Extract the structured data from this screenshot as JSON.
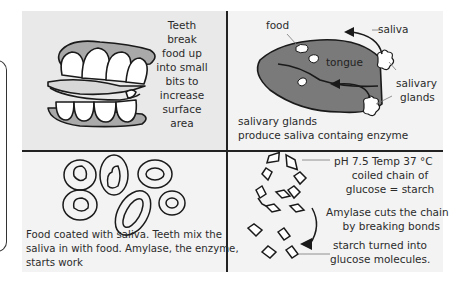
{
  "panels": {
    "teeth": {
      "caption_lines": [
        "Teeth",
        "break",
        "food up",
        "into small",
        "bits to",
        "increase",
        "surface",
        "area"
      ]
    },
    "tongue": {
      "labels": {
        "food": "food",
        "saliva": "saliva",
        "tongue": "tongue",
        "salivary_glands_1": "salivary",
        "salivary_glands_2": "glands"
      },
      "caption_lines": [
        "salivary glands",
        "produce saliva containg enzyme"
      ]
    },
    "mixing": {
      "caption_lines": [
        "Food coated with saliva. Teeth mix the",
        "saliva in with food. Amylase, the enzyme,",
        "starts work"
      ]
    },
    "starch": {
      "conditions": "pH 7.5 Temp 37 °C",
      "chain_label_lines": [
        "coiled chain of",
        "glucose = starch"
      ],
      "amylase_lines": [
        "Amylase cuts the chain",
        "by breaking bonds"
      ],
      "result_lines": [
        "starch turned into",
        "glucose molecules."
      ]
    }
  },
  "colors": {
    "tongue_fill": "#7a7a7a",
    "gum_fill": "#a9a9a9",
    "outline": "#1a1a1a"
  }
}
